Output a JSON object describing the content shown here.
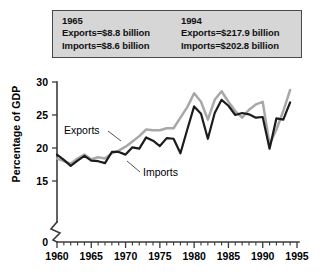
{
  "callout": {
    "left": {
      "year": "1965",
      "exports": "Exports=$8.8 billion",
      "imports": "Imports=$8.6 billion"
    },
    "right": {
      "year": "1994",
      "exports": "Exports=$217.9 billion",
      "imports": "Imports=$202.8 billion"
    }
  },
  "colors": {
    "exports_line": "#a8a8a8",
    "imports_line": "#1c1c1c",
    "callout_background": "#d6d6d6",
    "callout_border": "#4a4a4a",
    "axis": "#3b3b3b"
  },
  "annotations": {
    "exports_label": "Exports",
    "imports_label": "Imports"
  },
  "chart_data": {
    "type": "line",
    "title": "",
    "xlabel": "",
    "ylabel": "Percentage of GDP",
    "xlim": [
      1960,
      1995
    ],
    "ylim": [
      15,
      30
    ],
    "y_axis_break": true,
    "y_break_below": 15,
    "grid": false,
    "legend": "inline-annotations",
    "ytick_labels": [
      "0",
      "15",
      "20",
      "25",
      "30"
    ],
    "ytick_values": [
      0,
      15,
      20,
      25,
      30
    ],
    "xtick_labels": [
      "1960",
      "1965",
      "1970",
      "1975",
      "1980",
      "1985",
      "1990",
      "1995"
    ],
    "xtick_values": [
      1960,
      1965,
      1970,
      1975,
      1980,
      1985,
      1990,
      1995
    ],
    "xtick_minor_step": 1,
    "x": [
      1960,
      1961,
      1962,
      1963,
      1964,
      1965,
      1966,
      1967,
      1968,
      1969,
      1970,
      1971,
      1972,
      1973,
      1974,
      1975,
      1976,
      1977,
      1978,
      1979,
      1980,
      1981,
      1982,
      1983,
      1984,
      1985,
      1986,
      1987,
      1988,
      1989,
      1990,
      1991,
      1992,
      1993,
      1994
    ],
    "series": [
      {
        "name": "Exports",
        "color": "#a8a8a8",
        "values": [
          18.4,
          18.0,
          17.6,
          18.4,
          19.0,
          18.3,
          18.6,
          18.4,
          19.2,
          19.6,
          20.2,
          21.0,
          21.8,
          22.8,
          22.7,
          22.7,
          23.0,
          23.0,
          24.6,
          26.2,
          28.3,
          27.0,
          24.3,
          27.3,
          28.6,
          27.0,
          25.6,
          24.6,
          25.8,
          26.6,
          27.0,
          20.5,
          22.8,
          25.6,
          28.8
        ]
      },
      {
        "name": "Imports",
        "color": "#1c1c1c",
        "values": [
          19.0,
          18.2,
          17.3,
          18.1,
          18.8,
          18.1,
          18.0,
          17.7,
          19.4,
          19.4,
          19.0,
          20.1,
          19.9,
          21.6,
          21.1,
          20.3,
          21.5,
          21.4,
          19.2,
          22.8,
          26.3,
          25.2,
          21.4,
          25.3,
          27.3,
          26.4,
          25.0,
          25.3,
          25.1,
          24.6,
          24.7,
          19.9,
          24.5,
          24.3,
          26.9
        ]
      }
    ]
  }
}
